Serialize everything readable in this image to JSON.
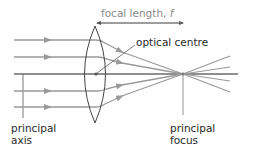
{
  "labels": {
    "focal_length": "focal length, ",
    "focal_symbol": "f",
    "optical_centre": "optical centre",
    "principal_axis_line1": "principal",
    "principal_axis_line2": "axis",
    "principal_focus_line1": "principal",
    "principal_focus_line2": "focus"
  },
  "colors": {
    "ray": "#9a9a9a",
    "axis": "#6a6a6a",
    "lens": "#444444",
    "pointer": "#555555",
    "text": "#2a2a2a",
    "focal_text": "#8a8a8a"
  },
  "geometry": {
    "principal_axis_y": 74,
    "lens_center_x": 95,
    "focus_x": 183,
    "incoming_rays_y": [
      40,
      57,
      91,
      107
    ],
    "outgoing_rays_end_y": [
      56,
      67,
      81,
      92
    ]
  }
}
